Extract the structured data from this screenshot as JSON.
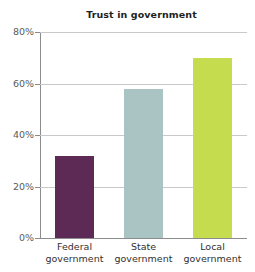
{
  "chart_data": {
    "type": "bar",
    "title": "Trust in government",
    "xlabel": "",
    "ylabel": "",
    "categories": [
      "Federal government",
      "State government",
      "Local government"
    ],
    "category_lines": [
      [
        "Federal",
        "government"
      ],
      [
        "State",
        "government"
      ],
      [
        "Local",
        "government"
      ]
    ],
    "values": [
      32,
      58,
      70
    ],
    "value_labels": [
      "32%",
      "58%",
      "70%"
    ],
    "ylim": [
      0,
      80
    ],
    "yticks": [
      0,
      20,
      40,
      60,
      80
    ],
    "ytick_labels": [
      "0%",
      "20%",
      "40%",
      "60%",
      "80%"
    ],
    "grid": true,
    "legend": "none",
    "bar_colors": [
      "#5c2a54",
      "#a9c4c2",
      "#c5dc4e"
    ],
    "axis_color": "#8c8c8c",
    "grid_color": "#c9c9c9",
    "title_color": "#221f1f",
    "tick_label_color": "#5a5a5a",
    "category_label_color": "#333030",
    "background": "#ffffff"
  }
}
